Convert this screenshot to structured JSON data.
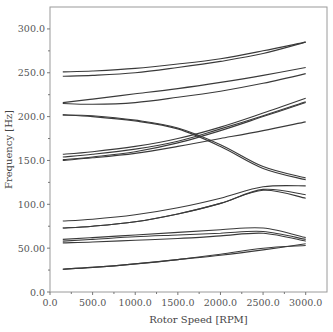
{
  "chart_data": {
    "type": "line",
    "title": "",
    "xlabel": "Rotor Speed [RPM]",
    "ylabel": "Frequency [Hz]",
    "xlim": [
      0,
      3250
    ],
    "ylim": [
      0,
      325
    ],
    "xticks": [
      0,
      500,
      1000,
      1500,
      2000,
      2500,
      3000
    ],
    "xtick_labels": [
      "0.0",
      "500.0",
      "1000.0",
      "1500.0",
      "2000.0",
      "2500.0",
      "3000.0"
    ],
    "yticks": [
      0,
      50,
      100,
      150,
      200,
      250,
      300
    ],
    "ytick_labels": [
      "0.0",
      "50.00",
      "100.0",
      "150.0",
      "200.0",
      "250.0",
      "300.0"
    ],
    "grid": false,
    "legend": null,
    "x": [
      150,
      500,
      1000,
      1500,
      2000,
      2500,
      3000
    ],
    "series": [
      {
        "name": "mode-1",
        "values": [
          251,
          252,
          255,
          260,
          266,
          275,
          285
        ]
      },
      {
        "name": "mode-2",
        "values": [
          246,
          247,
          250,
          256,
          263,
          272,
          285
        ]
      },
      {
        "name": "mode-3",
        "values": [
          216,
          220,
          226,
          232,
          239,
          247,
          256
        ]
      },
      {
        "name": "mode-4",
        "values": [
          215,
          214,
          216,
          222,
          229,
          238,
          249
        ]
      },
      {
        "name": "mode-5",
        "values": [
          202,
          201,
          196,
          187,
          168,
          143,
          130
        ]
      },
      {
        "name": "mode-6",
        "values": [
          202,
          200,
          195,
          186,
          166,
          141,
          128
        ]
      },
      {
        "name": "mode-7",
        "values": [
          157,
          160,
          166,
          175,
          188,
          204,
          221
        ]
      },
      {
        "name": "mode-8",
        "values": [
          154,
          157,
          163,
          172,
          186,
          201,
          217
        ]
      },
      {
        "name": "mode-9",
        "values": [
          151,
          154,
          160,
          170,
          184,
          200,
          216
        ]
      },
      {
        "name": "mode-10",
        "values": [
          150,
          153,
          158,
          166,
          175,
          184,
          194
        ]
      },
      {
        "name": "mode-11",
        "values": [
          81,
          83,
          88,
          96,
          107,
          120,
          121
        ]
      },
      {
        "name": "mode-12",
        "values": [
          73,
          75,
          80,
          89,
          101,
          117,
          111
        ]
      },
      {
        "name": "mode-13",
        "values": [
          73,
          75,
          80,
          89,
          101,
          116,
          107
        ]
      },
      {
        "name": "mode-14",
        "values": [
          60,
          62,
          65,
          68,
          71,
          73,
          62
        ]
      },
      {
        "name": "mode-15",
        "values": [
          58,
          60,
          63,
          65,
          67,
          69,
          60
        ]
      },
      {
        "name": "mode-16",
        "values": [
          56,
          57,
          59,
          61,
          64,
          67,
          58
        ]
      },
      {
        "name": "mode-17",
        "values": [
          26,
          28,
          32,
          37,
          42,
          48,
          55
        ]
      },
      {
        "name": "mode-18",
        "values": [
          26,
          28,
          32,
          37,
          43,
          50,
          53
        ]
      }
    ]
  }
}
